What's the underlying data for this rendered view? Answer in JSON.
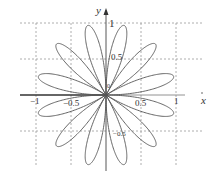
{
  "chart_data": {
    "type": "line",
    "subtype": "polar-rose",
    "equation": "r = sin(6θ)",
    "petals": 12,
    "petal_angles_deg": [
      15,
      45,
      75,
      105,
      135,
      165,
      195,
      225,
      255,
      285,
      315,
      345
    ],
    "petal_length": 1,
    "title": "",
    "xlabel": "x",
    "ylabel": "y",
    "xlim": [
      -1.2,
      1.4
    ],
    "ylim": [
      -1.1,
      1.1
    ],
    "grid": true,
    "grid_style": "dashed",
    "x_ticks": [
      -1,
      -0.5,
      0.5,
      1
    ],
    "x_tick_labels": [
      "−1",
      "−0.5",
      "0.5",
      "1"
    ],
    "y_ticks": [
      1,
      0.5,
      -0.5
    ],
    "y_tick_labels": [
      "1",
      "0.5",
      "−0.5"
    ],
    "origin_label": "0",
    "line_color": "#555555",
    "grid_color": "#9a9a9a"
  }
}
